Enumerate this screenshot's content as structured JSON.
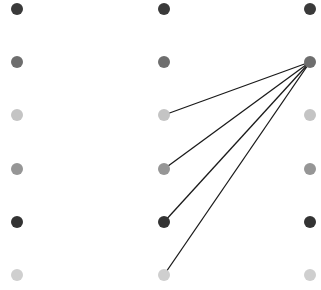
{
  "diagram": {
    "columns": [
      {
        "id": "left",
        "x": 17
      },
      {
        "id": "middle",
        "x": 164
      },
      {
        "id": "right",
        "x": 310
      }
    ],
    "rows_y": [
      9,
      62,
      115,
      169,
      222,
      275
    ],
    "row_colors": [
      "#3a3a3a",
      "#6e6e6e",
      "#c4c4c4",
      "#969696",
      "#333333",
      "#cfcfcf"
    ],
    "dot_radius": 6,
    "line_color": "#1a1a1a",
    "edges": [
      {
        "from": {
          "col": 2,
          "row": 1
        },
        "to": {
          "col": 1,
          "row": 2
        }
      },
      {
        "from": {
          "col": 2,
          "row": 1
        },
        "to": {
          "col": 1,
          "row": 3
        }
      },
      {
        "from": {
          "col": 2,
          "row": 1
        },
        "to": {
          "col": 1,
          "row": 4
        }
      },
      {
        "from": {
          "col": 2,
          "row": 1
        },
        "to": {
          "col": 1,
          "row": 5
        }
      }
    ]
  }
}
